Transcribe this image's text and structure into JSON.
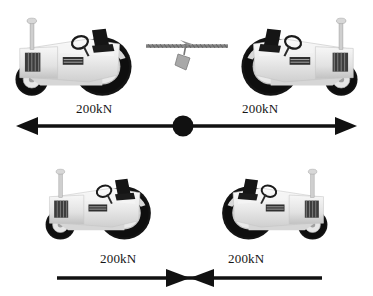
{
  "figure": {
    "type": "physics-free-body-illustration",
    "width": 373,
    "height": 296,
    "background_color": "#ffffff",
    "ink_color": "#111111"
  },
  "palette": {
    "ink": "#111111",
    "body_light": "#f2f2f2",
    "body_mid": "#dcdcdc",
    "body_shadow": "#bdbdbd",
    "body_dark": "#9e9e9e",
    "tire_black": "#141414",
    "hub_light": "#e6e6e6",
    "hub_mid": "#b5b5b5",
    "hub_center": "#8c8c8c",
    "seat_black": "#1b1b1b",
    "rope_gray": "#8a8a8a",
    "tag_gray": "#a8a8a8"
  },
  "panels": [
    {
      "id": "panel-top",
      "name": "tension-case",
      "description": "Two tractors facing away from each other, joined by a rope with a marker flag; arrows point outward from a central black dot.",
      "tractors": [
        {
          "position": "left",
          "facing": "right",
          "connected": "rope"
        },
        {
          "position": "right",
          "facing": "left",
          "connected": "rope"
        }
      ],
      "connector": {
        "kind": "rope",
        "marker": "pennant-tag"
      },
      "arrow": {
        "kind": "double-headed-outward",
        "center_marker": "filled-circle",
        "left_label": "200kN",
        "right_label": "200kN",
        "left_label_x": 76,
        "right_label_x": 242,
        "label_y": 108,
        "line_y": 126,
        "x_start": 18,
        "x_end": 356,
        "center_x": 183,
        "center_dot_r": 10
      }
    },
    {
      "id": "panel-bot",
      "name": "compression-case",
      "description": "Two tractors nose-to-nose pushing against each other; arrows point inward meeting at the centre.",
      "tractors": [
        {
          "position": "left",
          "facing": "right",
          "connected": "contact"
        },
        {
          "position": "right",
          "facing": "left",
          "connected": "contact"
        }
      ],
      "connector": {
        "kind": "direct-contact",
        "marker": "none"
      },
      "arrow": {
        "kind": "double-headed-inward",
        "center_marker": "meeting-arrowheads",
        "left_label": "200kN",
        "right_label": "200kN",
        "left_label_x": 100,
        "right_label_x": 228,
        "label_y": 258,
        "line_y": 278,
        "x_start": 57,
        "x_end": 322,
        "center_x": 189
      }
    }
  ],
  "labels": {
    "force_value": "200kN"
  }
}
